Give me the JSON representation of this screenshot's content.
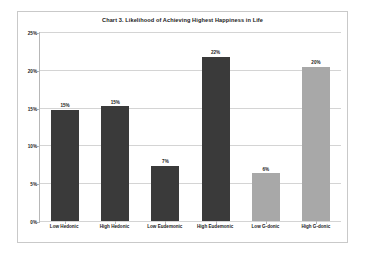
{
  "chart_data": {
    "type": "bar",
    "title": "Chart 3. Likelihood of Achieving Highest Happiness in Life",
    "xlabel": "",
    "ylabel": "",
    "categories": [
      "Low Hedonic",
      "High Hedonic",
      "Low Eudemonic",
      "High Eudemonic",
      "Low G-donic",
      "High G-donic"
    ],
    "values": [
      14.7,
      15.2,
      7.3,
      21.7,
      6.3,
      20.4
    ],
    "data_labels": [
      "15%",
      "15%",
      "7%",
      "22%",
      "6%",
      "20%"
    ],
    "bar_colors": [
      "#3a3a3a",
      "#3a3a3a",
      "#3a3a3a",
      "#3a3a3a",
      "#a8a8a8",
      "#a8a8a8"
    ],
    "ylim": [
      0,
      25
    ],
    "ytick_labels": [
      "25%",
      "20%",
      "15%",
      "10%",
      "5%",
      "0%"
    ],
    "ytick_values": [
      25,
      20,
      15,
      10,
      5,
      0
    ],
    "grid": true,
    "legend": "none"
  },
  "style": {
    "frame_border_color": "#c9c9c9",
    "gridline_color": "#d4d4d4",
    "axis_color": "#b7b7b7",
    "plot_background": "#ffffff",
    "text_color": "#1a1a1a"
  }
}
